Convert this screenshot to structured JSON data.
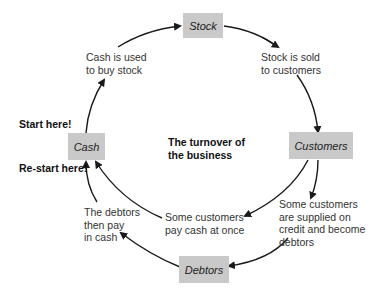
{
  "title": "The turnover of the business",
  "title_lines": [
    "The turnover of",
    "the business"
  ],
  "nodes": {
    "stock": "Stock",
    "customers": "Customers",
    "debtors": "Debtors",
    "cash": "Cash"
  },
  "labels": {
    "cash_to_stock": [
      "Cash is used",
      "to buy stock"
    ],
    "stock_to_customers": [
      "Stock is sold",
      "to customers"
    ],
    "customers_credit": [
      "Some customers",
      "are supplied on",
      "credit and become",
      "debtors"
    ],
    "customers_cash": [
      "Some customers",
      "pay cash at once"
    ],
    "debtors_pay": [
      "The debtors",
      "then pay",
      "in cash"
    ],
    "start": "Start here!",
    "restart": "Re-start here!"
  },
  "colors": {
    "box_fill": "#c9c9c9",
    "arrow": "#1a1a1a"
  }
}
